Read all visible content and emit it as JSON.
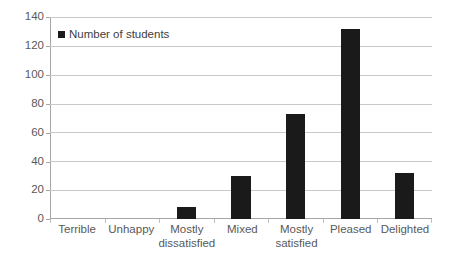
{
  "chart_data": {
    "type": "bar",
    "title": "",
    "subtitle": "",
    "xlabel": "",
    "ylabel": "",
    "categories": [
      "Terrible",
      "Unhappy",
      "Mostly dissatisfied",
      "Mixed",
      "Mostly satisfied",
      "Pleased",
      "Delighted"
    ],
    "category_display": [
      "Terrible",
      "Unhappy",
      "Mostly\ndissatisfied",
      "Mixed",
      "Mostly\nsatisfied",
      "Pleased",
      "Delighted"
    ],
    "series": [
      {
        "name": "Number of students",
        "values": [
          0,
          0,
          8,
          30,
          73,
          132,
          32
        ]
      }
    ],
    "values": [
      0,
      0,
      8,
      30,
      73,
      132,
      32
    ],
    "ylim": [
      0,
      140
    ],
    "ytick_step": 20,
    "yticks": [
      0,
      20,
      40,
      60,
      80,
      100,
      120,
      140
    ],
    "ytick_labels": [
      "0",
      "20",
      "40",
      "60",
      "80",
      "100",
      "120",
      "140"
    ],
    "grid": true,
    "grid_axis": "y",
    "legend": {
      "visible": true,
      "position": "top-left-inside",
      "entries": [
        {
          "label": "Number of students",
          "marker": "square-marker",
          "color": "#1a1a1a"
        }
      ]
    },
    "colors": {
      "bar": "#1a1a1a",
      "gridline": "#c9c9c9",
      "axis": "#a6a6a6",
      "text": "#595959",
      "background": "#ffffff"
    }
  }
}
